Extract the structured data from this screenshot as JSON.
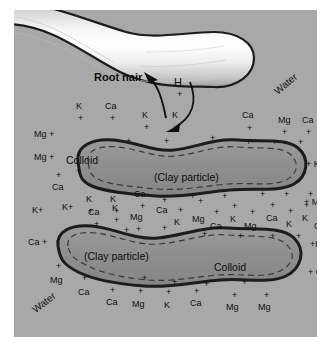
{
  "figure": {
    "background_color": "#a8a8a8",
    "particle_fill": "#8f8f8f",
    "outline_color": "#1a1a1a",
    "root_hair_color": "#e8e8e8"
  },
  "labels": {
    "root_hair": "Root hair",
    "hydrogen": "H",
    "hydrogen_charge": "+",
    "water_top": "Water",
    "water_bottom": "Water",
    "colloid_upper": "Colloid",
    "clay_particle_upper": "(Clay particle)",
    "colloid_lower": "Colloid",
    "clay_particle_lower": "(Clay particle)"
  },
  "ions": {
    "row_top": [
      {
        "text": "K",
        "x": 62,
        "y": 92,
        "plus_x": 64,
        "plus_y": 104
      },
      {
        "text": "Ca",
        "x": 91,
        "y": 92,
        "plus_x": 96,
        "plus_y": 104
      },
      {
        "text": "K",
        "x": 128,
        "y": 101,
        "plus_x": 130,
        "plus_y": 113
      },
      {
        "text": "K",
        "x": 158,
        "y": 101,
        "plus_x": 160,
        "plus_y": 115
      },
      {
        "text": "Ca",
        "x": 228,
        "y": 101,
        "plus_x": 233,
        "plus_y": 114
      },
      {
        "text": "Mg",
        "x": 264,
        "y": 106,
        "plus_x": 268,
        "plus_y": 118
      },
      {
        "text": "Ca",
        "x": 288,
        "y": 106,
        "plus_x": 292,
        "plus_y": 118
      },
      {
        "text": "K",
        "x": 312,
        "y": 106,
        "plus_x": 314,
        "plus_y": 118
      }
    ],
    "left_upper": [
      {
        "text": "Mg +",
        "x": 20,
        "y": 120
      },
      {
        "text": "Mg +",
        "x": 20,
        "y": 143
      },
      {
        "text": "Ca",
        "x": 38,
        "y": 173,
        "plus_x": 42,
        "plus_y": 161
      }
    ],
    "right_upper": [
      {
        "text": "+ K",
        "x": 292,
        "y": 150
      },
      {
        "text": "+ Mg",
        "x": 290,
        "y": 188
      }
    ],
    "mid_cluster": [
      {
        "text": "K",
        "x": 72,
        "y": 185,
        "plus_x": 74,
        "plus_y": 197
      },
      {
        "text": "K",
        "x": 96,
        "y": 185,
        "plus_x": 100,
        "plus_y": 197
      },
      {
        "text": "Ca",
        "x": 120,
        "y": 180,
        "plus_x": 126,
        "plus_y": 192
      },
      {
        "text": "K+",
        "x": 18,
        "y": 196
      },
      {
        "text": "K+",
        "x": 48,
        "y": 193
      },
      {
        "text": "Ca",
        "x": 74,
        "y": 198,
        "plus_x": 80,
        "plus_y": 210
      },
      {
        "text": "K",
        "x": 98,
        "y": 194,
        "plus_x": 100,
        "plus_y": 206
      },
      {
        "text": "Mg",
        "x": 116,
        "y": 203,
        "plus_x": 122,
        "plus_y": 215
      },
      {
        "text": "Ca",
        "x": 142,
        "y": 196,
        "plus_x": 148,
        "plus_y": 186
      },
      {
        "text": "K",
        "x": 160,
        "y": 208,
        "plus_x": 164,
        "plus_y": 196
      },
      {
        "text": "Mg",
        "x": 178,
        "y": 205,
        "plus_x": 184,
        "plus_y": 187
      },
      {
        "text": "Ca",
        "x": 196,
        "y": 212,
        "plus_x": 200,
        "plus_y": 198
      },
      {
        "text": "K",
        "x": 216,
        "y": 205,
        "plus_x": 218,
        "plus_y": 192
      },
      {
        "text": "Mg",
        "x": 230,
        "y": 212,
        "plus_x": 236,
        "plus_y": 198
      },
      {
        "text": "Ca",
        "x": 252,
        "y": 204,
        "plus_x": 256,
        "plus_y": 191
      },
      {
        "text": "K",
        "x": 272,
        "y": 210,
        "plus_x": 274,
        "plus_y": 197
      },
      {
        "text": "K",
        "x": 288,
        "y": 204,
        "plus_x": 290,
        "plus_y": 191
      },
      {
        "text": "Ca",
        "x": 300,
        "y": 212,
        "plus_x": 304,
        "plus_y": 197
      },
      {
        "text": "Ca",
        "x": 318,
        "y": 203
      }
    ],
    "left_lower": [
      {
        "text": "Ca +",
        "x": 14,
        "y": 228
      },
      {
        "text": "Mg",
        "x": 36,
        "y": 266,
        "plus_x": 42,
        "plus_y": 252
      },
      {
        "text": "Ca",
        "x": 64,
        "y": 278,
        "plus_x": 68,
        "plus_y": 264
      }
    ],
    "right_lower": [
      {
        "text": "+K",
        "x": 296,
        "y": 230
      },
      {
        "text": "+ Ca",
        "x": 294,
        "y": 258
      }
    ],
    "row_bottom": [
      {
        "text": "Ca",
        "x": 92,
        "y": 288,
        "plus_x": 96,
        "plus_y": 276
      },
      {
        "text": "Mg",
        "x": 118,
        "y": 290,
        "plus_x": 124,
        "plus_y": 277
      },
      {
        "text": "K",
        "x": 150,
        "y": 291,
        "plus_x": 152,
        "plus_y": 278
      },
      {
        "text": "Ca",
        "x": 176,
        "y": 289,
        "plus_x": 180,
        "plus_y": 277
      },
      {
        "text": "Mg",
        "x": 212,
        "y": 293,
        "plus_x": 218,
        "plus_y": 281
      },
      {
        "text": "Mg",
        "x": 244,
        "y": 293,
        "plus_x": 250,
        "plus_y": 281
      }
    ],
    "upper_particle_surface": [
      {
        "plus_x": 112,
        "plus_y": 127
      },
      {
        "plus_x": 150,
        "plus_y": 127
      },
      {
        "plus_x": 196,
        "plus_y": 124
      },
      {
        "plus_x": 232,
        "plus_y": 128
      },
      {
        "plus_x": 258,
        "plus_y": 128
      },
      {
        "plus_x": 284,
        "plus_y": 128
      },
      {
        "plus_x": 62,
        "plus_y": 157
      },
      {
        "plus_x": 176,
        "plus_y": 182
      },
      {
        "plus_x": 208,
        "plus_y": 182
      },
      {
        "plus_x": 246,
        "plus_y": 180
      },
      {
        "plus_x": 270,
        "plus_y": 180
      },
      {
        "plus_x": 294,
        "plus_y": 180
      }
    ],
    "lower_particle_surface": [
      {
        "plus_x": 110,
        "plus_y": 216
      },
      {
        "plus_x": 148,
        "plus_y": 214
      },
      {
        "plus_x": 188,
        "plus_y": 220
      },
      {
        "plus_x": 224,
        "plus_y": 222
      },
      {
        "plus_x": 256,
        "plus_y": 222
      },
      {
        "plus_x": 282,
        "plus_y": 222
      },
      {
        "plus_x": 128,
        "plus_y": 264
      },
      {
        "plus_x": 158,
        "plus_y": 268
      },
      {
        "plus_x": 190,
        "plus_y": 270
      },
      {
        "plus_x": 228,
        "plus_y": 268
      }
    ]
  }
}
